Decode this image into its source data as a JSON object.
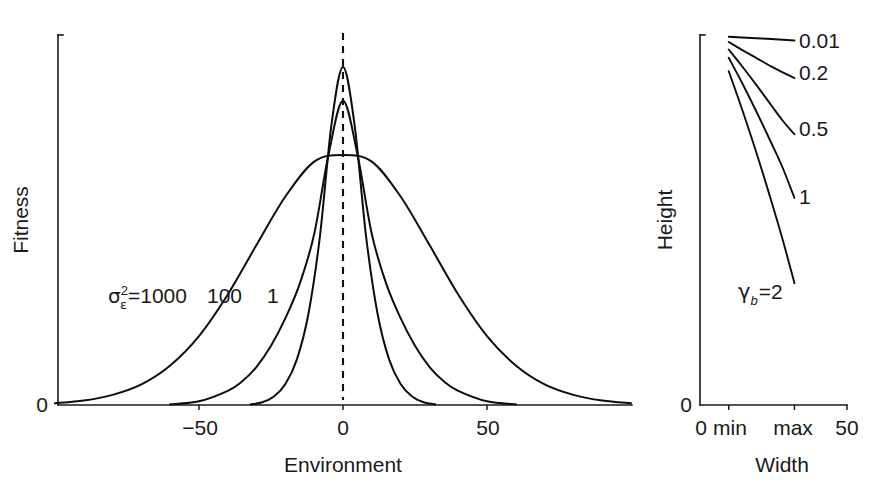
{
  "figure": {
    "background_color": "#ffffff",
    "ink_color": "#111111",
    "panels": [
      "fitness-vs-environment",
      "height-vs-width"
    ]
  },
  "chart_data": [
    {
      "id": "left-panel",
      "type": "line",
      "title": "",
      "xlabel": "Environment",
      "ylabel": "Fitness",
      "xlim": [
        -100,
        100
      ],
      "xticks": [
        -50,
        0,
        50
      ],
      "xtick_labels": [
        "−50",
        "0",
        "50"
      ],
      "ylim": [
        0,
        1.08
      ],
      "yticks": [
        0
      ],
      "ytick_labels": [
        "0"
      ],
      "grid": false,
      "legend_position": "inline-annotations",
      "annotations": [
        {
          "name": "sigma-epsilon-squared-1000",
          "text": "σε²=1000",
          "parts": {
            "symbol": "σ",
            "superscript": "2",
            "subscript": "ε",
            "equals": "=",
            "value": "1000"
          },
          "x_px": 108,
          "y_px": 302
        },
        {
          "name": "label-100",
          "text": "100",
          "x_px": 207,
          "y_px": 302
        },
        {
          "name": "label-1",
          "text": "1",
          "x_px": 267,
          "y_px": 302
        }
      ],
      "vertical_reference_line": {
        "name": "optimum-dashed-line",
        "x": 0,
        "style": "dashed"
      },
      "series": [
        {
          "name": "σε²=1000",
          "variance": 1000,
          "peak_height": 0.74,
          "sd_environment": 31.6,
          "x": [
            -100,
            -90,
            -80,
            -70,
            -60,
            -50,
            -40,
            -30,
            -20,
            -10,
            0,
            10,
            20,
            30,
            40,
            50,
            60,
            70,
            80,
            90,
            100
          ],
          "y": [
            0.005,
            0.013,
            0.03,
            0.061,
            0.117,
            0.204,
            0.327,
            0.474,
            0.617,
            0.72,
            0.74,
            0.72,
            0.617,
            0.474,
            0.327,
            0.204,
            0.117,
            0.061,
            0.03,
            0.013,
            0.005
          ]
        },
        {
          "name": "σε²=100",
          "variance": 100,
          "peak_height": 0.9,
          "sd_environment": 14.0,
          "x": [
            -60,
            -50,
            -40,
            -35,
            -30,
            -25,
            -20,
            -15,
            -10,
            -5,
            0,
            5,
            10,
            15,
            20,
            25,
            30,
            35,
            40,
            50,
            60
          ],
          "y": [
            0.002,
            0.011,
            0.042,
            0.07,
            0.113,
            0.175,
            0.257,
            0.359,
            0.506,
            0.742,
            0.9,
            0.742,
            0.506,
            0.359,
            0.257,
            0.175,
            0.113,
            0.07,
            0.042,
            0.011,
            0.002
          ]
        },
        {
          "name": "σε²=1",
          "variance": 1,
          "peak_height": 1.0,
          "sd_environment": 8.5,
          "x": [
            -32,
            -28,
            -24,
            -20,
            -16,
            -12,
            -8,
            -4,
            0,
            4,
            8,
            12,
            16,
            20,
            24,
            28,
            32
          ],
          "y": [
            0.002,
            0.008,
            0.025,
            0.062,
            0.135,
            0.27,
            0.5,
            0.83,
            1.0,
            0.83,
            0.5,
            0.27,
            0.135,
            0.062,
            0.025,
            0.008,
            0.002
          ]
        }
      ]
    },
    {
      "id": "right-panel",
      "type": "line",
      "title": "",
      "xlabel": "Width",
      "ylabel": "Height",
      "xlim": [
        0,
        50
      ],
      "xticks": [
        0,
        9.5,
        32,
        50
      ],
      "xtick_labels": [
        "0",
        "min",
        "max",
        "50"
      ],
      "ylim": [
        0,
        1.0
      ],
      "yticks": [
        0
      ],
      "ytick_labels": [
        "0"
      ],
      "grid": false,
      "legend_position": "right-of-curve-ends",
      "series": [
        {
          "name": "0.01",
          "gamma_b": 0.01,
          "label": "0.01",
          "label_x_px": 799,
          "label_y_px": 48,
          "x": [
            9.5,
            14,
            19,
            24,
            28,
            32
          ],
          "y": [
            0.982,
            0.98,
            0.978,
            0.976,
            0.974,
            0.972
          ]
        },
        {
          "name": "0.2",
          "gamma_b": 0.2,
          "label": "0.2",
          "label_x_px": 799,
          "label_y_px": 80,
          "x": [
            9.5,
            14,
            19,
            24,
            28,
            32
          ],
          "y": [
            0.968,
            0.947,
            0.925,
            0.903,
            0.887,
            0.872
          ]
        },
        {
          "name": "0.5",
          "gamma_b": 0.5,
          "label": "0.5",
          "label_x_px": 799,
          "label_y_px": 136,
          "x": [
            9.5,
            14,
            19,
            24,
            28,
            32
          ],
          "y": [
            0.948,
            0.904,
            0.853,
            0.8,
            0.758,
            0.722
          ]
        },
        {
          "name": "1",
          "gamma_b": 1,
          "label": "1",
          "label_x_px": 799,
          "label_y_px": 204,
          "x": [
            9.5,
            14,
            19,
            24,
            28,
            32
          ],
          "y": [
            0.926,
            0.86,
            0.782,
            0.7,
            0.632,
            0.552
          ]
        },
        {
          "name": "γb=2",
          "gamma_b": 2,
          "label": "γb=2",
          "parts": {
            "symbol": "γ",
            "subscript": "b",
            "equals": "=",
            "value": "2"
          },
          "label_x_px": 770,
          "label_y_px": 299,
          "x": [
            9.5,
            14,
            19,
            24,
            28,
            32
          ],
          "y": [
            0.89,
            0.79,
            0.672,
            0.546,
            0.44,
            0.325
          ]
        }
      ]
    }
  ],
  "left_panel": {
    "y_axis_label": "Fitness",
    "y_zero_label": "0",
    "x_axis_label": "Environment",
    "x_tick_labels": [
      "−50",
      "0",
      "50"
    ],
    "series_labels": {
      "wide": "1000",
      "mid": "100",
      "narrow": "1"
    },
    "sigma": {
      "symbol": "σ",
      "superscript": "2",
      "subscript": "ε",
      "equals": "="
    }
  },
  "right_panel": {
    "y_axis_label": "Height",
    "y_zero_label": "0",
    "x_axis_label": "Width",
    "x_tick_labels": [
      "0",
      "min",
      "max",
      "50"
    ],
    "series_labels": [
      "0.01",
      "0.2",
      "0.5",
      "1"
    ],
    "gamma": {
      "symbol": "γ",
      "subscript": "b",
      "equals": "=",
      "value": "2"
    }
  }
}
